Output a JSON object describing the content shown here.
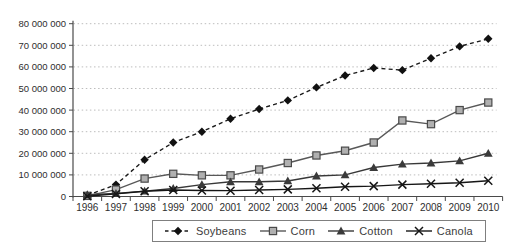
{
  "chart_data": {
    "type": "line",
    "title": "",
    "xlabel": "",
    "ylabel": "",
    "x": [
      1996,
      1997,
      1998,
      1999,
      2000,
      2001,
      2002,
      2003,
      2004,
      2005,
      2006,
      2007,
      2008,
      2009,
      2010
    ],
    "x_tick_labels": [
      "1996",
      "1997",
      "1998",
      "1999",
      "2000",
      "2001",
      "2002",
      "2003",
      "2004",
      "2005",
      "2006",
      "2007",
      "2008",
      "2009",
      "2010"
    ],
    "ylim": [
      0,
      80000000
    ],
    "y_tick_step": 10000000,
    "y_tick_labels": [
      "0",
      "10 000 000",
      "20 000 000",
      "30 000 000",
      "40 000 000",
      "50 000 000",
      "60 000 000",
      "70 000 000",
      "80 000 000"
    ],
    "grid": "horizontal-dotted",
    "legend_position": "bottom-center",
    "colors": {
      "background": "#ffffff",
      "axis": "#4a4a4a",
      "grid": "#bdbdbd",
      "tick_text": "#2e2e2e"
    },
    "series": [
      {
        "name": "Soybeans",
        "marker": "diamond",
        "line_style": "dashed",
        "line_color": "#1a1a1a",
        "marker_fill": "#111111",
        "values": [
          500000,
          5500000,
          17000000,
          25000000,
          30000000,
          36000000,
          40500000,
          44500000,
          50500000,
          56000000,
          59500000,
          58500000,
          64000000,
          69500000,
          73000000
        ]
      },
      {
        "name": "Corn",
        "marker": "square",
        "line_style": "solid",
        "line_color": "#585858",
        "marker_fill": "#b0b0b0",
        "marker_stroke": "#4a4a4a",
        "values": [
          300000,
          3200000,
          8300000,
          10500000,
          9800000,
          9800000,
          12500000,
          15500000,
          19000000,
          21200000,
          25000000,
          35200000,
          33500000,
          40000000,
          43500000
        ]
      },
      {
        "name": "Cotton",
        "marker": "triangle",
        "line_style": "solid",
        "line_color": "#383838",
        "marker_fill": "#3a3a3a",
        "values": [
          800000,
          1400000,
          2500000,
          3700000,
          5500000,
          6800000,
          6800000,
          7200000,
          9500000,
          10000000,
          13400000,
          15000000,
          15500000,
          16500000,
          20000000
        ]
      },
      {
        "name": "Canola",
        "marker": "x",
        "line_style": "solid",
        "line_color": "#161616",
        "marker_fill": "#161616",
        "values": [
          100000,
          1200000,
          2400000,
          3000000,
          2800000,
          2700000,
          3000000,
          3300000,
          3800000,
          4500000,
          4800000,
          5500000,
          5900000,
          6400000,
          7300000
        ]
      }
    ]
  }
}
